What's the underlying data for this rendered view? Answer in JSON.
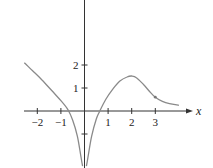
{
  "chart_data": {
    "type": "line",
    "title": "",
    "xlabel": "x",
    "ylabel": "y",
    "xlim": [
      -2.6,
      4.6
    ],
    "ylim": [
      -2.4,
      4.8
    ],
    "grid": false,
    "legend": null,
    "x_ticks": [
      -2,
      -1,
      1,
      2,
      3
    ],
    "x_tick_labels": [
      "−2",
      "−1",
      "1",
      "2",
      "3"
    ],
    "y_ticks": [
      -1,
      1,
      2
    ],
    "y_tick_labels": [
      "",
      "1",
      "2"
    ],
    "series": [
      {
        "name": "left branch",
        "color": "#8a8a8a",
        "x": [
          -2.55,
          -2.2,
          -1.8,
          -1.4,
          -1.0,
          -0.7,
          -0.5,
          -0.3,
          -0.15,
          -0.08
        ],
        "y": [
          2.1,
          1.75,
          1.35,
          0.9,
          0.45,
          0.05,
          -0.4,
          -1.1,
          -2.0,
          -2.4
        ]
      },
      {
        "name": "right branch",
        "color": "#8a8a8a",
        "x": [
          0.08,
          0.15,
          0.3,
          0.5,
          0.65,
          0.9,
          1.2,
          1.5,
          1.8,
          2.0,
          2.2,
          2.5,
          2.8,
          3.0,
          3.3,
          3.6,
          4.0
        ],
        "y": [
          -2.4,
          -2.0,
          -1.1,
          -0.35,
          0.0,
          0.5,
          0.95,
          1.3,
          1.48,
          1.52,
          1.45,
          1.15,
          0.8,
          0.6,
          0.42,
          0.32,
          0.25
        ]
      }
    ],
    "annotations": [
      {
        "type": "point",
        "x": 3,
        "y": 0.6,
        "label": ""
      }
    ]
  },
  "axes": {
    "x_label": "x",
    "y_label": "y"
  }
}
